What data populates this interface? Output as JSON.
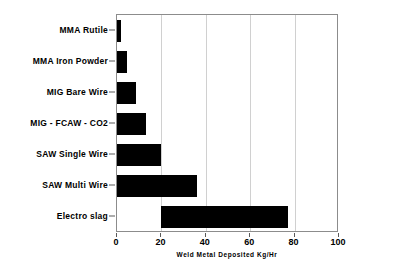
{
  "chart_data": {
    "type": "bar",
    "orientation": "horizontal",
    "title": "",
    "xlabel": "Weld Metal Deposited Kg/Hr",
    "ylabel": "",
    "categories": [
      "MMA Rutile",
      "MMA Iron Powder",
      "MIG Bare Wire",
      "MIG - FCAW - CO2",
      "SAW Single Wire",
      "SAW Multi Wire",
      "Electro slag"
    ],
    "values": [
      1.7,
      4.3,
      8.5,
      13,
      20,
      36,
      77
    ],
    "bar_starts": [
      0,
      0,
      0,
      0,
      0,
      0,
      20
    ],
    "xlim": [
      0,
      100
    ],
    "xticks": [
      0,
      20,
      40,
      60,
      80,
      100
    ],
    "xtick_labels": [
      "0",
      "20",
      "40",
      "60",
      "80",
      "100"
    ],
    "gridlines": [
      20,
      40,
      60,
      80
    ],
    "grid": true,
    "legend": false,
    "bar_color": "#000000",
    "grid_color": "#d0d0d0",
    "frame_color": "#8c8c8c",
    "background": "#ffffff"
  }
}
